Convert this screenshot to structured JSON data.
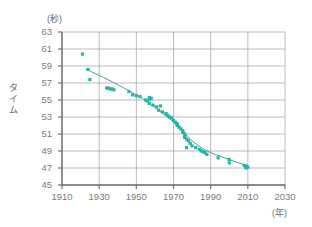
{
  "chart_data": {
    "type": "scatter",
    "title": "",
    "xlabel": "(年)",
    "ylabel": "タイム",
    "y_unit": "(秒)",
    "xlim": [
      1910,
      2030
    ],
    "ylim": [
      45,
      63
    ],
    "grid": true,
    "legend": false,
    "x_ticks": [
      "1910",
      "1930",
      "1950",
      "1970",
      "1990",
      "2010",
      "2030"
    ],
    "y_ticks": [
      "63",
      "61",
      "59",
      "57",
      "55",
      "53",
      "51",
      "49",
      "47",
      "45"
    ],
    "x_tick_values": [
      1910,
      1930,
      1950,
      1970,
      1990,
      2010,
      2030
    ],
    "y_tick_values": [
      63,
      61,
      59,
      57,
      55,
      53,
      51,
      49,
      47,
      45
    ],
    "point_color": "#27b3a4",
    "line_color": "#3aa99c",
    "axis_color": "#888888",
    "grid_color": "#a8a8a8",
    "series": [
      {
        "name": "records",
        "type": "scatter",
        "points": [
          [
            1921,
            60.4
          ],
          [
            1924,
            58.6
          ],
          [
            1925,
            57.4
          ],
          [
            1934,
            56.4
          ],
          [
            1935,
            56.4
          ],
          [
            1936,
            56.3
          ],
          [
            1937,
            56.3
          ],
          [
            1938,
            56.2
          ],
          [
            1946,
            56.0
          ],
          [
            1948,
            55.6
          ],
          [
            1950,
            55.5
          ],
          [
            1952,
            55.4
          ],
          [
            1955,
            55.0
          ],
          [
            1956,
            54.9
          ],
          [
            1957,
            55.3
          ],
          [
            1957,
            55.1
          ],
          [
            1957,
            54.6
          ],
          [
            1958,
            55.2
          ],
          [
            1959,
            54.4
          ],
          [
            1961,
            54.2
          ],
          [
            1962,
            53.8
          ],
          [
            1963,
            54.3
          ],
          [
            1964,
            53.6
          ],
          [
            1966,
            53.4
          ],
          [
            1967,
            53.2
          ],
          [
            1968,
            53.0
          ],
          [
            1969,
            52.9
          ],
          [
            1970,
            52.6
          ],
          [
            1971,
            52.4
          ],
          [
            1972,
            52.2
          ],
          [
            1972,
            52.0
          ],
          [
            1973,
            51.8
          ],
          [
            1974,
            51.6
          ],
          [
            1975,
            51.4
          ],
          [
            1975,
            51.2
          ],
          [
            1976,
            51.0
          ],
          [
            1976,
            50.8
          ],
          [
            1976,
            50.6
          ],
          [
            1977,
            50.4
          ],
          [
            1977,
            49.4
          ],
          [
            1978,
            50.2
          ],
          [
            1979,
            49.9
          ],
          [
            1980,
            49.6
          ],
          [
            1982,
            49.4
          ],
          [
            1984,
            49.2
          ],
          [
            1985,
            49.0
          ],
          [
            1986,
            48.9
          ],
          [
            1987,
            48.8
          ],
          [
            1988,
            48.6
          ],
          [
            1994,
            48.2
          ],
          [
            2000,
            48.0
          ],
          [
            2000,
            47.6
          ],
          [
            2008,
            47.3
          ],
          [
            2009,
            47.2
          ],
          [
            2009,
            47.0
          ],
          [
            2010,
            47.1
          ]
        ]
      },
      {
        "name": "trend-curve",
        "type": "line",
        "points": [
          [
            1923,
            58.6
          ],
          [
            1930,
            57.9
          ],
          [
            1940,
            56.8
          ],
          [
            1950,
            55.6
          ],
          [
            1955,
            54.9
          ],
          [
            1960,
            54.1
          ],
          [
            1965,
            53.3
          ],
          [
            1970,
            52.4
          ],
          [
            1975,
            51.3
          ],
          [
            1980,
            50.2
          ],
          [
            1985,
            49.4
          ],
          [
            1990,
            48.8
          ],
          [
            1995,
            48.4
          ],
          [
            2000,
            48.0
          ],
          [
            2005,
            47.6
          ],
          [
            2010,
            47.3
          ]
        ]
      }
    ]
  }
}
